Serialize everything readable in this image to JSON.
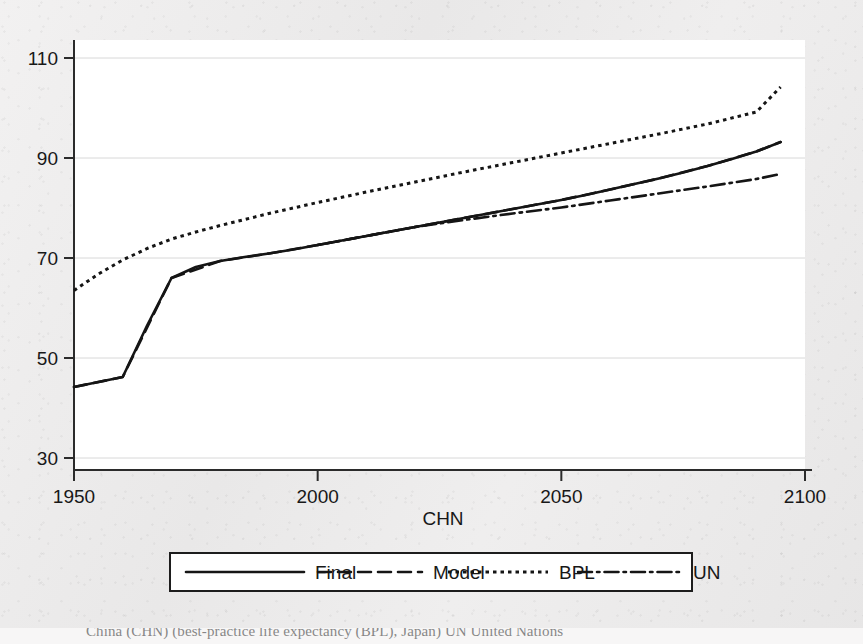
{
  "figure": {
    "background_color": "#eeeded",
    "plot_background_color": "#ffffff",
    "line_color": "#151515",
    "grid_color": "#d8d8d8",
    "caption": "China (CHN) (best-practice life expectancy (BPL), Japan) UN United Nations"
  },
  "chart_data": {
    "type": "line",
    "title": "",
    "subtitle": "",
    "xlabel": "CHN",
    "ylabel": "",
    "xlim": [
      1950,
      2100
    ],
    "ylim": [
      30,
      110
    ],
    "xticks": [
      1950,
      2000,
      2050,
      2100
    ],
    "yticks": [
      30,
      50,
      70,
      90,
      110
    ],
    "xtick_labels": [
      "1950",
      "2000",
      "2050",
      "2100"
    ],
    "ytick_labels": [
      "30",
      "50",
      "70",
      "90",
      "110"
    ],
    "grid": "horizontal",
    "legend_position": "below-axis-center",
    "series": [
      {
        "name": "Final",
        "style": "solid",
        "x": [
          1950,
          1955,
          1960,
          1965,
          1970,
          1975,
          1980,
          1985,
          1990,
          1995,
          2000,
          2005,
          2010,
          2015,
          2020,
          2025,
          2030,
          2035,
          2040,
          2045,
          2050,
          2055,
          2060,
          2065,
          2070,
          2075,
          2080,
          2085,
          2090,
          2095
        ],
        "values": [
          44.2,
          45.2,
          46.2,
          56.5,
          66.0,
          68.2,
          69.4,
          70.2,
          70.9,
          71.7,
          72.6,
          73.5,
          74.4,
          75.3,
          76.2,
          77.1,
          78.0,
          78.9,
          79.8,
          80.7,
          81.6,
          82.6,
          83.7,
          84.8,
          85.9,
          87.1,
          88.4,
          89.8,
          91.3,
          93.2
        ]
      },
      {
        "name": "Model",
        "style": "dashed",
        "note": "coincides with Final over the plotted range",
        "x": [
          1950,
          1960,
          1970,
          1980,
          1990,
          2000,
          2010,
          2020,
          2030,
          2040,
          2050,
          2060,
          2070,
          2080,
          2090,
          2095
        ],
        "values": [
          44.2,
          46.2,
          66.0,
          69.4,
          70.9,
          72.6,
          74.4,
          76.2,
          78.0,
          79.8,
          81.6,
          83.7,
          85.9,
          88.4,
          91.3,
          93.2
        ]
      },
      {
        "name": "BPL",
        "style": "dotted",
        "x": [
          1950,
          1955,
          1960,
          1965,
          1970,
          1975,
          1980,
          1985,
          1990,
          1995,
          2000,
          2010,
          2020,
          2030,
          2040,
          2050,
          2060,
          2070,
          2080,
          2090,
          2095
        ],
        "values": [
          63.5,
          66.8,
          69.6,
          71.9,
          73.8,
          75.2,
          76.5,
          77.7,
          78.9,
          80.0,
          81.1,
          83.2,
          85.2,
          87.2,
          89.1,
          91.0,
          92.9,
          94.8,
          96.8,
          99.2,
          104.2
        ]
      },
      {
        "name": "UN",
        "style": "dash-dot",
        "x": [
          2000,
          2010,
          2020,
          2030,
          2040,
          2050,
          2060,
          2070,
          2080,
          2090,
          2095
        ],
        "values": [
          72.6,
          74.4,
          76.2,
          77.6,
          78.9,
          80.1,
          81.5,
          82.9,
          84.3,
          85.8,
          86.8
        ]
      }
    ]
  },
  "legend": {
    "entries": [
      {
        "label": "Final",
        "style": "solid"
      },
      {
        "label": "Model",
        "style": "dashed"
      },
      {
        "label": "BPL",
        "style": "dotted"
      },
      {
        "label": "UN",
        "style": "dash-dot"
      }
    ]
  },
  "axis_label": {
    "x": "CHN"
  }
}
